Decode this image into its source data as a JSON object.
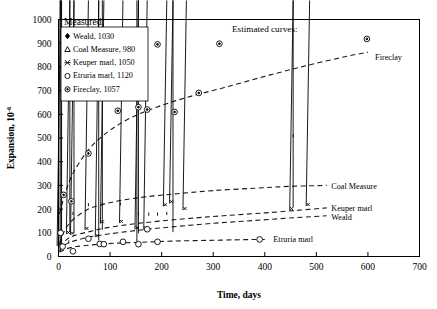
{
  "chart_data": {
    "type": "scatter",
    "title": "",
    "xlabel": "Time, days",
    "ylabel": "Expansion, 10",
    "ylabel_sup": "-6",
    "xlim": [
      0,
      700
    ],
    "ylim": [
      0,
      1000
    ],
    "xticks": [
      0,
      100,
      200,
      300,
      400,
      500,
      600,
      700
    ],
    "yticks": [
      0,
      100,
      200,
      300,
      400,
      500,
      600,
      700,
      800,
      900,
      1000
    ],
    "grid": false,
    "legend_position": "top-left",
    "legend_title": "Measured:",
    "annotations": [
      {
        "name": "estimated-curves-note",
        "text": "Estimated curves:",
        "x": 330,
        "y": 930
      }
    ],
    "series": [
      {
        "name": "Weald",
        "legend_label": "Weald, 1030",
        "marker": "filled-diamond",
        "curve_label": "Weald",
        "points": [
          [
            3,
            10
          ],
          [
            5,
            42
          ],
          [
            6,
            48
          ],
          [
            22,
            92
          ],
          [
            30,
            85
          ],
          [
            78,
            55
          ],
          [
            85,
            100
          ],
          [
            152,
            50
          ],
          [
            155,
            85
          ],
          [
            222,
            90
          ],
          [
            455,
            195
          ]
        ],
        "curve": [
          [
            2,
            20
          ],
          [
            10,
            45
          ],
          [
            25,
            62
          ],
          [
            60,
            82
          ],
          [
            100,
            96
          ],
          [
            160,
            112
          ],
          [
            220,
            125
          ],
          [
            300,
            140
          ],
          [
            380,
            152
          ],
          [
            460,
            164
          ],
          [
            520,
            172
          ]
        ]
      },
      {
        "name": "Coal Measure",
        "legend_label": "Coal Measure, 980",
        "marker": "open-triangle",
        "curve_label": "Coal Measure",
        "points": [
          [
            5,
            50
          ],
          [
            20,
            55
          ],
          [
            28,
            175
          ],
          [
            58,
            212
          ],
          [
            85,
            215
          ],
          [
            120,
            215
          ],
          [
            155,
            173
          ],
          [
            175,
            172
          ],
          [
            192,
            172
          ],
          [
            210,
            175
          ],
          [
            455,
            502
          ]
        ],
        "curve": [
          [
            2,
            55
          ],
          [
            12,
            110
          ],
          [
            28,
            155
          ],
          [
            58,
            200
          ],
          [
            90,
            222
          ],
          [
            125,
            238
          ],
          [
            170,
            252
          ],
          [
            230,
            265
          ],
          [
            300,
            278
          ],
          [
            380,
            288
          ],
          [
            450,
            296
          ],
          [
            520,
            300
          ]
        ]
      },
      {
        "name": "Keuper marl",
        "legend_label": "Keuper marl, 1050",
        "marker": "x-star",
        "curve_label": "Keuper marl",
        "points": [
          [
            4,
            45
          ],
          [
            22,
            95
          ],
          [
            30,
            92
          ],
          [
            58,
            112
          ],
          [
            78,
            82
          ],
          [
            88,
            140
          ],
          [
            125,
            142
          ],
          [
            155,
            115
          ],
          [
            172,
            115
          ],
          [
            210,
            212
          ],
          [
            222,
            225
          ],
          [
            248,
            196
          ],
          [
            455,
            196
          ],
          [
            487,
            213
          ]
        ],
        "curve": [
          [
            2,
            40
          ],
          [
            15,
            70
          ],
          [
            30,
            88
          ],
          [
            60,
            105
          ],
          [
            95,
            122
          ],
          [
            140,
            136
          ],
          [
            190,
            148
          ],
          [
            250,
            160
          ],
          [
            320,
            172
          ],
          [
            400,
            184
          ],
          [
            470,
            196
          ],
          [
            520,
            205
          ]
        ]
      },
      {
        "name": "Etruria marl",
        "legend_label": "Etruria marl, 1120",
        "marker": "open-circle",
        "curve_label": "Etruria marl",
        "points": [
          [
            4,
            100
          ],
          [
            8,
            42
          ],
          [
            28,
            22
          ],
          [
            58,
            75
          ],
          [
            80,
            53
          ],
          [
            88,
            52
          ],
          [
            125,
            62
          ],
          [
            155,
            52
          ],
          [
            172,
            115
          ],
          [
            192,
            62
          ],
          [
            390,
            72
          ]
        ],
        "curve": [
          [
            2,
            18
          ],
          [
            15,
            32
          ],
          [
            35,
            42
          ],
          [
            70,
            50
          ],
          [
            110,
            56
          ],
          [
            160,
            60
          ],
          [
            220,
            65
          ],
          [
            290,
            68
          ],
          [
            360,
            71
          ],
          [
            400,
            72
          ]
        ]
      },
      {
        "name": "Fireclay",
        "legend_label": "Fireclay, 1057",
        "marker": "dotted-circle",
        "curve_label": "Fireclay",
        "points": [
          [
            10,
            260
          ],
          [
            25,
            233
          ],
          [
            58,
            435
          ],
          [
            115,
            615
          ],
          [
            155,
            630
          ],
          [
            172,
            620
          ],
          [
            192,
            895
          ],
          [
            225,
            610
          ],
          [
            272,
            690
          ],
          [
            312,
            898
          ],
          [
            598,
            918
          ]
        ],
        "curve": [
          [
            2,
            180
          ],
          [
            12,
            260
          ],
          [
            28,
            350
          ],
          [
            58,
            450
          ],
          [
            95,
            525
          ],
          [
            140,
            585
          ],
          [
            190,
            630
          ],
          [
            250,
            672
          ],
          [
            320,
            712
          ],
          [
            400,
            760
          ],
          [
            480,
            805
          ],
          [
            560,
            845
          ],
          [
            600,
            862
          ]
        ]
      }
    ]
  },
  "axes": {
    "x_title": "Time, days",
    "y_title_main": "Expansion, 10",
    "y_title_exp": "-6",
    "x_tick_labels": [
      "0",
      "100",
      "200",
      "300",
      "400",
      "500",
      "600",
      "700"
    ],
    "y_tick_labels": [
      "0",
      "100",
      "200",
      "300",
      "400",
      "500",
      "600",
      "700",
      "800",
      "900",
      "1000"
    ]
  },
  "legend": {
    "title": "Measured:",
    "items": [
      {
        "label": "Weald, 1030",
        "marker": "filled-diamond"
      },
      {
        "label": "Coal Measure, 980",
        "marker": "open-triangle"
      },
      {
        "label": "Keuper marl, 1050",
        "marker": "x-star"
      },
      {
        "label": "Etruria marl, 1120",
        "marker": "open-circle"
      },
      {
        "label": "Fireclay, 1057",
        "marker": "dotted-circle"
      }
    ]
  },
  "annotations": {
    "estimated_curves": "Estimated curves:",
    "curve_labels": {
      "fireclay": "Fireclay",
      "coal_measure": "Coal Measure",
      "keuper_marl": "Keuper marl",
      "weald": "Weald",
      "etruria_marl": "Etruria marl"
    }
  },
  "colors": {
    "line": "#1a1a1a",
    "text": "#000000",
    "background": "#ffffff"
  }
}
